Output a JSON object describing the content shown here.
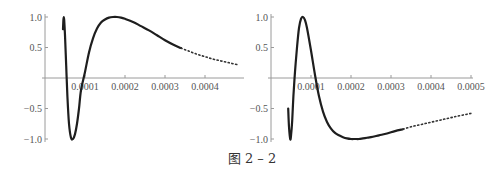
{
  "caption": "图 2 – 2",
  "chart_data": [
    {
      "type": "line",
      "title": "",
      "xlabel": "",
      "ylabel": "",
      "xlim": [
        0,
        0.00049
      ],
      "ylim": [
        -1.0,
        1.0
      ],
      "x_ticks": [
        "0.0001",
        "0.0002",
        "0.0003",
        "0.0004"
      ],
      "y_ticks": [
        "1.0",
        "0.5",
        "-0.5",
        "-1.0"
      ],
      "grid": false,
      "series": [
        {
          "name": "curve",
          "x": [
            4.5e-05,
            4.6e-05,
            4.7e-05,
            4.8e-05,
            5e-05,
            5.3e-05,
            5.6e-05,
            6e-05,
            6.5e-05,
            7e-05,
            7.5e-05,
            8e-05,
            8.5e-05,
            9e-05,
            0.0001,
            0.00011,
            0.00012,
            0.00013,
            0.00014,
            0.00015,
            0.00016,
            0.00017,
            0.00018,
            0.00019,
            0.0002,
            0.00022,
            0.00024,
            0.00026,
            0.00028,
            0.0003,
            0.00032,
            0.00034,
            0.00036,
            0.00038,
            0.0004,
            0.00042,
            0.00044,
            0.00046,
            0.00048
          ],
          "y": [
            0.8,
            0.95,
            1.0,
            0.95,
            0.7,
            0.2,
            -0.3,
            -0.75,
            -0.98,
            -1.0,
            -0.92,
            -0.75,
            -0.5,
            -0.2,
            0.1,
            0.42,
            0.65,
            0.81,
            0.91,
            0.96,
            0.99,
            1.0,
            1.0,
            0.99,
            0.97,
            0.92,
            0.85,
            0.78,
            0.7,
            0.62,
            0.55,
            0.49,
            0.44,
            0.39,
            0.35,
            0.31,
            0.28,
            0.25,
            0.22
          ],
          "dotted_from_x": 0.00033
        }
      ]
    },
    {
      "type": "line",
      "title": "",
      "xlabel": "",
      "ylabel": "",
      "xlim": [
        0,
        0.0005
      ],
      "ylim": [
        -1.0,
        1.0
      ],
      "x_ticks": [
        "0.0001",
        "0.0002",
        "0.0003",
        "0.0004",
        "0.0005"
      ],
      "y_ticks": [
        "1.0",
        "0.5",
        "-0.5",
        "-1.0"
      ],
      "grid": false,
      "series": [
        {
          "name": "curve",
          "x": [
            4.3e-05,
            4.5e-05,
            4.8e-05,
            5e-05,
            5.3e-05,
            5.6e-05,
            6e-05,
            6.5e-05,
            7e-05,
            7.5e-05,
            8e-05,
            8.5e-05,
            9e-05,
            0.0001,
            0.00011,
            0.00012,
            0.00013,
            0.00014,
            0.00015,
            0.00016,
            0.00017,
            0.00018,
            0.00019,
            0.0002,
            0.00021,
            0.00022,
            0.00023,
            0.00024,
            0.00025,
            0.00027,
            0.00029,
            0.00031,
            0.00033,
            0.00035,
            0.00037,
            0.00039,
            0.00041,
            0.00043,
            0.00045,
            0.00047,
            0.0005
          ],
          "y": [
            -0.5,
            -0.8,
            -1.0,
            -0.95,
            -0.7,
            -0.3,
            0.1,
            0.5,
            0.82,
            0.97,
            1.0,
            0.95,
            0.82,
            0.45,
            0.05,
            -0.3,
            -0.55,
            -0.72,
            -0.83,
            -0.9,
            -0.94,
            -0.97,
            -0.99,
            -1.0,
            -1.0,
            -1.0,
            -0.99,
            -0.98,
            -0.97,
            -0.94,
            -0.91,
            -0.87,
            -0.84,
            -0.8,
            -0.77,
            -0.74,
            -0.71,
            -0.68,
            -0.65,
            -0.62,
            -0.58
          ],
          "dotted_from_x": 0.00033
        }
      ]
    }
  ]
}
